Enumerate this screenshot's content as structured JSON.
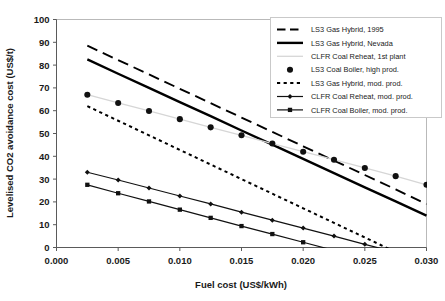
{
  "chart_data": {
    "type": "line",
    "title": "",
    "xlabel": "Fuel cost (US$/kWh)",
    "ylabel": "Levelised CO2 avoidance cost (US$/t)",
    "xlim": [
      0.0,
      0.03
    ],
    "ylim": [
      0,
      100
    ],
    "xticks": [
      "0.000",
      "0.005",
      "0.010",
      "0.015",
      "0.020",
      "0.025",
      "0.030"
    ],
    "xtick_values": [
      0.0,
      0.005,
      0.01,
      0.015,
      0.02,
      0.025,
      0.03
    ],
    "yticks": [
      "0",
      "10",
      "20",
      "30",
      "40",
      "50",
      "60",
      "70",
      "80",
      "90",
      "100"
    ],
    "ytick_values": [
      0,
      10,
      20,
      30,
      40,
      50,
      60,
      70,
      80,
      90,
      100
    ],
    "grid": false,
    "legend_position": "top-right",
    "x": [
      0.0025,
      0.005,
      0.0075,
      0.01,
      0.0125,
      0.015,
      0.0175,
      0.02,
      0.0225,
      0.025,
      0.0275,
      0.03
    ],
    "series": [
      {
        "name": "LS3 Gas Hybrid, 1995",
        "style": "long-dash",
        "marker": "none",
        "color": "#000000",
        "width": 1.9,
        "values": [
          88.5,
          82.2,
          75.9,
          69.6,
          63.3,
          57.0,
          50.7,
          44.4,
          38.1,
          31.8,
          25.5,
          19.0
        ]
      },
      {
        "name": "LS3 Gas Hybrid, Nevada",
        "style": "solid",
        "marker": "none",
        "color": "#000000",
        "width": 2.4,
        "values": [
          82.5,
          76.2,
          70.0,
          63.8,
          57.6,
          51.3,
          45.1,
          38.9,
          32.6,
          26.4,
          20.2,
          14.0
        ]
      },
      {
        "name": "CLFR Coal Reheat, 1st plant",
        "style": "solid",
        "marker": "none",
        "color": "#d6d6d6",
        "width": 1.3,
        "values": [
          67.0,
          63.4,
          59.9,
          56.3,
          52.7,
          49.2,
          45.6,
          42.0,
          38.5,
          34.9,
          31.3,
          27.5
        ]
      },
      {
        "name": "LS3 Coal Boiler, high prod.",
        "style": "none",
        "marker": "circle",
        "color": "#111111",
        "width": 0,
        "values": [
          67.0,
          63.4,
          59.9,
          56.3,
          52.7,
          49.2,
          45.6,
          42.0,
          38.5,
          34.9,
          31.3,
          27.5
        ]
      },
      {
        "name": "LS3 Gas Hybrid, mod. prod.",
        "style": "dotted",
        "marker": "none",
        "color": "#000000",
        "width": 2.0,
        "values": [
          62.0,
          55.6,
          49.2,
          42.8,
          36.4,
          30.0,
          23.6,
          17.2,
          10.8,
          4.4,
          -2.0,
          -8.4
        ]
      },
      {
        "name": "CLFR Coal Reheat, mod. prod.",
        "style": "solid",
        "marker": "small-diamond",
        "color": "#111111",
        "width": 1.2,
        "values": [
          33.0,
          29.6,
          26.1,
          22.6,
          19.1,
          15.5,
          12.0,
          8.5,
          5.0,
          1.4,
          -2.1,
          -5.6
        ]
      },
      {
        "name": "CLFR Coal Boiler, mod. prod.",
        "style": "solid",
        "marker": "square",
        "color": "#111111",
        "width": 1.2,
        "values": [
          27.5,
          23.8,
          20.2,
          16.6,
          13.0,
          9.4,
          5.9,
          2.3,
          -1.3,
          -4.9,
          -8.5,
          -12.1
        ]
      }
    ],
    "annotations": []
  },
  "legend": {
    "items": [
      {
        "label": "LS3 Gas Hybrid, 1995",
        "swatch": "long-dash-swatch"
      },
      {
        "label": "LS3 Gas Hybrid, Nevada",
        "swatch": "thick-solid-swatch"
      },
      {
        "label": "CLFR Coal Reheat, 1st plant",
        "swatch": "thin-gray-line-swatch"
      },
      {
        "label": "LS3 Coal Boiler, high prod.",
        "swatch": "circle-marker-swatch"
      },
      {
        "label": "LS3 Gas Hybrid, mod. prod.",
        "swatch": "dotted-swatch"
      },
      {
        "label": "CLFR Coal Reheat, mod. prod.",
        "swatch": "line-diamond-swatch"
      },
      {
        "label": "CLFR Coal Boiler, mod. prod.",
        "swatch": "line-square-swatch"
      }
    ]
  },
  "axes": {
    "x_title": "Fuel cost (US$/kWh)",
    "y_title": "Levelised CO2 avoidance cost (US$/t)",
    "x_tick_labels": [
      "0.000",
      "0.005",
      "0.010",
      "0.015",
      "0.020",
      "0.025",
      "0.030"
    ],
    "y_tick_labels": [
      "0",
      "10",
      "20",
      "30",
      "40",
      "50",
      "60",
      "70",
      "80",
      "90",
      "100"
    ]
  }
}
